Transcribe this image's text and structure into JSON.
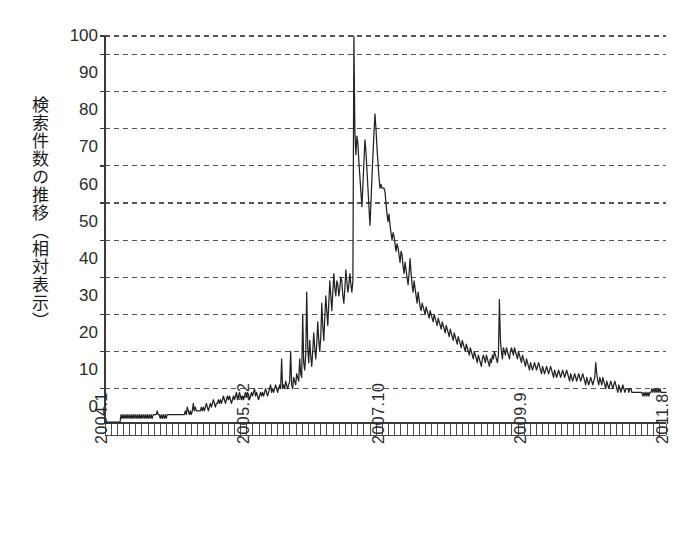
{
  "chart_data": {
    "type": "line",
    "title": "",
    "subtitle": "",
    "ylabel": "検索件数の推移（相対表示）",
    "xlabel": "",
    "ylim": [
      -4,
      100
    ],
    "yticks": [
      0,
      10,
      20,
      30,
      40,
      50,
      60,
      70,
      80,
      90,
      100
    ],
    "ytick_labels": [
      "0",
      "10",
      "20",
      "30",
      "40",
      "50",
      "60",
      "70",
      "80",
      "90",
      "100"
    ],
    "gridlines": [
      5,
      15,
      25,
      35,
      45,
      55,
      65,
      75,
      85,
      95,
      100
    ],
    "grid": true,
    "grid_style": "dashed",
    "legend": "none",
    "line_color": "#222222",
    "axis_color": "#3a3a3a",
    "grid_color": "#555555",
    "background": "#ffffff",
    "x_start_label": "2004.1",
    "x_end_label": "2011.8",
    "x_tick_interval_months": 1,
    "xtick_labels": [
      "2004.1",
      "2005.12",
      "2007.10",
      "2009.9",
      "2011.8"
    ],
    "xtick_positions": [
      0,
      23,
      45,
      68,
      91
    ],
    "x_months_total": 92,
    "series": [
      {
        "name": "検索件数（相対）",
        "x": [
          "2004.1",
          "2004.2",
          "2004.3",
          "2004.4",
          "2004.5",
          "2004.6",
          "2004.7",
          "2004.8",
          "2004.9",
          "2004.10",
          "2004.11",
          "2004.12",
          "2005.1",
          "2005.2",
          "2005.3",
          "2005.4",
          "2005.5",
          "2005.6",
          "2005.7",
          "2005.8",
          "2005.9",
          "2005.10",
          "2005.11",
          "2005.12",
          "2006.1",
          "2006.2",
          "2006.3",
          "2006.4",
          "2006.5",
          "2006.6",
          "2006.7",
          "2006.8",
          "2006.9",
          "2006.10",
          "2006.11",
          "2006.12",
          "2007.1",
          "2007.2",
          "2007.3",
          "2007.4",
          "2007.5",
          "2007.6",
          "2007.7",
          "2007.8",
          "2007.9",
          "2007.10",
          "2007.11",
          "2007.12",
          "2008.1",
          "2008.2",
          "2008.3",
          "2008.4",
          "2008.5",
          "2008.6",
          "2008.7",
          "2008.8",
          "2008.9",
          "2008.10",
          "2008.11",
          "2008.12",
          "2009.1",
          "2009.2",
          "2009.3",
          "2009.4",
          "2009.5",
          "2009.6",
          "2009.7",
          "2009.8",
          "2009.9",
          "2009.10",
          "2009.11",
          "2009.12",
          "2010.1",
          "2010.2",
          "2010.3",
          "2010.4",
          "2010.5",
          "2010.6",
          "2010.7",
          "2010.8",
          "2010.9",
          "2010.10",
          "2010.11",
          "2010.12",
          "2011.1",
          "2011.2",
          "2011.3",
          "2011.4",
          "2011.5",
          "2011.6",
          "2011.7",
          "2011.8"
        ],
        "values_weekly": [
          -4,
          -4,
          -4,
          -4,
          -4,
          -4,
          -4,
          -4,
          -4,
          -4,
          -4,
          -4,
          -4,
          -4,
          -4,
          -4,
          -2,
          -3,
          -2,
          -3,
          -2,
          -3,
          -2,
          -3,
          -2,
          -3,
          -2,
          -3,
          -2,
          -3,
          -2,
          -3,
          -2,
          -3,
          -2,
          -3,
          -2,
          -3,
          -2,
          -3,
          -2,
          -3,
          -2,
          -3,
          -2,
          -3,
          -2,
          -3,
          -2,
          -2,
          -2,
          -2,
          -1,
          -2,
          -2,
          -3,
          -2,
          -3,
          -2,
          -3,
          -2,
          -3,
          -2,
          -2,
          -2,
          -2,
          -2,
          -2,
          -2,
          -2,
          -2,
          -2,
          -2,
          -2,
          -2,
          -2,
          -2,
          -2,
          -2,
          -2,
          -1,
          -2,
          0,
          -1,
          -2,
          -1,
          -2,
          -1,
          1,
          -1,
          0,
          -1,
          -1,
          -1,
          -1,
          -1,
          0,
          -1,
          0,
          -1,
          0,
          1,
          0,
          -1,
          0,
          1,
          0,
          1,
          2,
          1,
          0,
          1,
          1,
          2,
          1,
          2,
          1,
          2,
          3,
          2,
          1,
          2,
          3,
          2,
          3,
          2,
          1,
          2,
          3,
          2,
          3,
          4,
          2,
          3,
          4,
          3,
          2,
          3,
          2,
          3,
          4,
          3,
          4,
          3,
          2,
          3,
          4,
          3,
          4,
          5,
          3,
          4,
          3,
          2,
          3,
          4,
          3,
          4,
          3,
          4,
          5,
          4,
          3,
          4,
          5,
          6,
          4,
          5,
          4,
          5,
          6,
          5,
          4,
          5,
          6,
          5,
          13,
          5,
          6,
          5,
          7,
          6,
          5,
          6,
          7,
          15,
          6,
          5,
          8,
          7,
          6,
          9,
          8,
          7,
          13,
          9,
          8,
          25,
          12,
          10,
          14,
          31,
          16,
          12,
          18,
          14,
          11,
          15,
          20,
          16,
          13,
          17,
          23,
          18,
          15,
          19,
          28,
          22,
          18,
          24,
          30,
          26,
          22,
          28,
          34,
          30,
          26,
          31,
          36,
          32,
          30,
          34,
          33,
          30,
          32,
          35,
          34,
          30,
          28,
          32,
          37,
          34,
          31,
          33,
          36,
          33,
          31,
          34,
          100,
          74,
          68,
          73,
          71,
          66,
          62,
          58,
          54,
          60,
          66,
          72,
          69,
          64,
          59,
          54,
          49,
          55,
          62,
          68,
          74,
          79,
          75,
          70,
          66,
          62,
          59,
          60,
          59,
          59,
          59,
          58,
          55,
          52,
          50,
          52,
          49,
          47,
          45,
          47,
          46,
          44,
          42,
          44,
          43,
          41,
          39,
          42,
          41,
          38,
          36,
          39,
          37,
          35,
          33,
          36,
          40,
          36,
          33,
          31,
          34,
          32,
          30,
          28,
          31,
          29,
          27,
          26,
          28,
          27,
          26,
          25,
          27,
          26,
          25,
          24,
          26,
          25,
          24,
          23,
          25,
          24,
          23,
          22,
          24,
          23,
          22,
          21,
          23,
          22,
          21,
          20,
          22,
          21,
          20,
          19,
          21,
          20,
          19,
          18,
          20,
          19,
          18,
          17,
          19,
          18,
          17,
          16,
          18,
          17,
          16,
          15,
          17,
          16,
          15,
          14,
          16,
          15,
          14,
          13,
          15,
          14,
          13,
          12,
          14,
          13,
          12,
          11,
          13,
          14,
          13,
          12,
          14,
          13,
          12,
          11,
          13,
          12,
          14,
          13,
          15,
          14,
          13,
          12,
          14,
          29,
          18,
          15,
          13,
          16,
          15,
          14,
          16,
          15,
          14,
          13,
          15,
          16,
          15,
          14,
          16,
          15,
          14,
          13,
          15,
          14,
          13,
          12,
          14,
          13,
          12,
          11,
          13,
          12,
          11,
          10,
          12,
          11,
          10,
          11,
          12,
          11,
          10,
          11,
          12,
          11,
          10,
          9,
          11,
          10,
          9,
          10,
          11,
          10,
          9,
          10,
          11,
          10,
          9,
          8,
          10,
          9,
          8,
          9,
          10,
          9,
          8,
          9,
          10,
          9,
          8,
          9,
          10,
          9,
          8,
          7,
          9,
          8,
          7,
          8,
          9,
          8,
          7,
          8,
          9,
          8,
          7,
          8,
          9,
          8,
          7,
          6,
          8,
          7,
          6,
          7,
          8,
          7,
          6,
          7,
          8,
          12,
          9,
          7,
          6,
          8,
          7,
          6,
          8,
          7,
          6,
          5,
          7,
          6,
          5,
          6,
          7,
          6,
          5,
          6,
          7,
          6,
          5,
          4,
          6,
          5,
          4,
          5,
          6,
          5,
          4,
          5,
          5,
          5,
          4,
          5,
          5,
          4,
          4,
          4,
          4,
          4,
          4,
          4,
          4,
          4,
          4,
          4,
          3,
          4,
          3,
          4,
          3,
          4,
          3,
          4,
          4,
          5,
          4,
          5,
          4,
          5,
          4,
          5,
          4,
          5,
          4,
          4,
          4,
          4,
          4,
          4
        ],
        "peak_value": 100,
        "peak_label": "2007.9付近",
        "baseline_value": -4
      }
    ]
  },
  "axis": {
    "y_title": "検索件数の推移（相対表示）",
    "y_title_lines": [
      "検索件数の推移",
      "（相対表示）"
    ]
  }
}
